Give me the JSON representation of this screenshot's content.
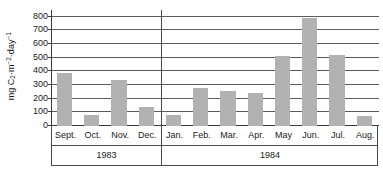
{
  "chart_data": {
    "type": "bar",
    "title": "",
    "subtitle": "",
    "xlabel": "",
    "ylabel": "mg C2·m-2·day-1",
    "ylabel_parts": {
      "prefix": "mg C",
      "c_subscript": "2",
      "mid": "·m",
      "m_exponent": "−2",
      "mid2": "·day",
      "day_exponent": "−1"
    },
    "ylim": [
      0,
      850
    ],
    "yticks": [
      0,
      100,
      200,
      300,
      400,
      500,
      600,
      700,
      800
    ],
    "ytick_labels": [
      "0",
      "100",
      "200",
      "300",
      "400",
      "500",
      "600",
      "700",
      "800"
    ],
    "grid": true,
    "grid_axis": "y",
    "legend": null,
    "legend_position": "none",
    "categories": [
      "Sept.",
      "Oct.",
      "Nov.",
      "Dec.",
      "Jan.",
      "Feb.",
      "Mar.",
      "Apr.",
      "May",
      "Jun.",
      "Jul.",
      "Aug."
    ],
    "values": [
      385,
      80,
      340,
      140,
      80,
      280,
      255,
      245,
      510,
      790,
      520,
      70
    ],
    "groups": [
      {
        "label": "1983",
        "categories": [
          "Sept.",
          "Oct.",
          "Nov.",
          "Dec."
        ]
      },
      {
        "label": "1984",
        "categories": [
          "Jan.",
          "Feb.",
          "Mar.",
          "Apr.",
          "May",
          "Jun.",
          "Jul.",
          "Aug."
        ]
      }
    ],
    "bar_color": "#b2b2b2",
    "axis_color": "#3a3a3a",
    "gridline_color": "#5c5c5c",
    "background_color": "#ffffff"
  }
}
